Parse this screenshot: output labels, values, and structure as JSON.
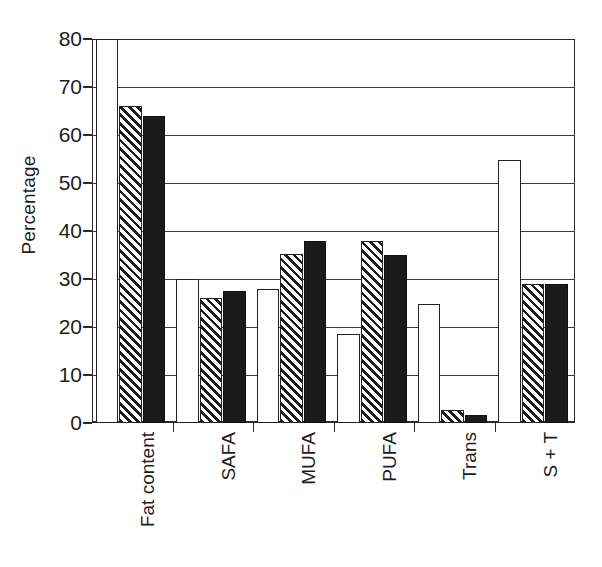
{
  "chart_data": {
    "type": "bar",
    "title": "",
    "subtitle": "",
    "xlabel": "",
    "ylabel": "Percentage",
    "categories": [
      "Fat content",
      "SAFA",
      "MUFA",
      "PUFA",
      "Trans",
      "S + T"
    ],
    "series": [
      {
        "name": "series-1-open",
        "fill": "white-open",
        "values": [
          80.0,
          30.0,
          28.0,
          18.6,
          24.8,
          54.7
        ]
      },
      {
        "name": "series-2-hatch",
        "fill": "diagonal-hatched",
        "values": [
          66.0,
          26.0,
          35.3,
          38.0,
          2.8,
          29.0
        ]
      },
      {
        "name": "series-3-solid",
        "fill": "solid-black",
        "values": [
          64.0,
          27.4,
          38.0,
          35.0,
          1.6,
          29.0
        ]
      }
    ],
    "ylim": [
      0,
      80
    ],
    "ytick_values": [
      0,
      10,
      20,
      30,
      40,
      50,
      60,
      70,
      80
    ],
    "ytick_labels": [
      "0",
      "10",
      "20",
      "30",
      "40",
      "50",
      "60",
      "70",
      "80"
    ],
    "grid": true,
    "grid_axis": "y",
    "legend": "none",
    "legend_position": "none",
    "annotations": [],
    "colors": {
      "axis": "#2b2b2b",
      "grid": "#3a3a3a",
      "text": "#1d1d1d",
      "open_fill": "#ffffff",
      "hatch_fill": "#1c1c1c",
      "solid_fill": "#1a1a1a",
      "background": "#ffffff"
    }
  }
}
